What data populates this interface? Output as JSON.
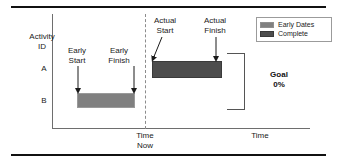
{
  "diagram": {
    "title_rules": {
      "present": true
    },
    "axes": {
      "y_label": "Activity\nID",
      "x_label": "Time",
      "time_now_label": "Time\nNow"
    },
    "rows": [
      {
        "id": "A"
      },
      {
        "id": "B"
      }
    ],
    "annotations": [
      {
        "name": "early-start",
        "label": "Early\nStart"
      },
      {
        "name": "early-finish",
        "label": "Early\nFinish"
      },
      {
        "name": "actual-start",
        "label": "Actual\nStart"
      },
      {
        "name": "actual-finish",
        "label": "Actual\nFinish"
      }
    ],
    "legend": {
      "items": [
        {
          "label": "Early Dates",
          "color": "#808080"
        },
        {
          "label": "Complete",
          "color": "#4d4d4d"
        }
      ]
    },
    "goal": {
      "title": "Goal",
      "value": "0%"
    },
    "colors": {
      "early_dates": "#808080",
      "complete": "#4d4d4d",
      "axis": "#6e6e6e",
      "rule": "#111111",
      "time_now": "#8c8c8c"
    }
  }
}
